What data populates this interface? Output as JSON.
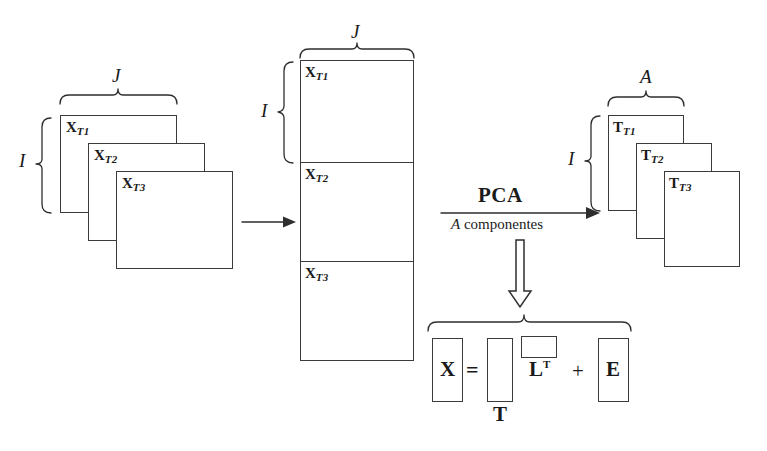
{
  "figure": {
    "language": "es"
  },
  "left_group": {
    "name": "original-slabs",
    "top_brace_label": "J",
    "left_brace_label": "I",
    "slabs": [
      {
        "label": "X",
        "subscript": "T1"
      },
      {
        "label": "X",
        "subscript": "T2"
      },
      {
        "label": "X",
        "subscript": "T3"
      }
    ]
  },
  "unfold_arrow": {
    "direction": "right",
    "label": ""
  },
  "middle_matrix": {
    "name": "unfolded-matrix",
    "top_brace_label": "J",
    "left_brace_label": "I",
    "blocks": [
      {
        "label": "X",
        "subscript": "T1"
      },
      {
        "label": "X",
        "subscript": "T2"
      },
      {
        "label": "X",
        "subscript": "T3"
      }
    ]
  },
  "pca_arrow": {
    "name": "pca-operation",
    "above_label": "PCA",
    "below_label_italic": "A",
    "below_label_rest": " componentes"
  },
  "right_group": {
    "name": "scores-slabs",
    "top_brace_label": "A",
    "left_brace_label": "I",
    "slabs": [
      {
        "label": "T",
        "subscript": "T1"
      },
      {
        "label": "T",
        "subscript": "T2"
      },
      {
        "label": "T",
        "subscript": "T3"
      }
    ]
  },
  "down_arrow": {
    "direction": "down",
    "style": "hollow"
  },
  "equation": {
    "name": "pca-decomposition",
    "terms": [
      {
        "id": "X",
        "label": "X",
        "kind": "boxed-letter"
      },
      {
        "id": "equals",
        "label": "=",
        "kind": "operator"
      },
      {
        "id": "T",
        "label": "T",
        "kind": "scores-matrix",
        "caption": "T"
      },
      {
        "id": "Lt",
        "label": "L",
        "superscript": "T",
        "kind": "loadings-matrix"
      },
      {
        "id": "plus",
        "label": "+",
        "kind": "operator"
      },
      {
        "id": "E",
        "label": "E",
        "kind": "boxed-letter"
      }
    ]
  },
  "colors": {
    "stroke": "#2e2e2e",
    "box_border": "#3b3b3b",
    "background": "#ffffff",
    "text": "#1a1a1a"
  }
}
